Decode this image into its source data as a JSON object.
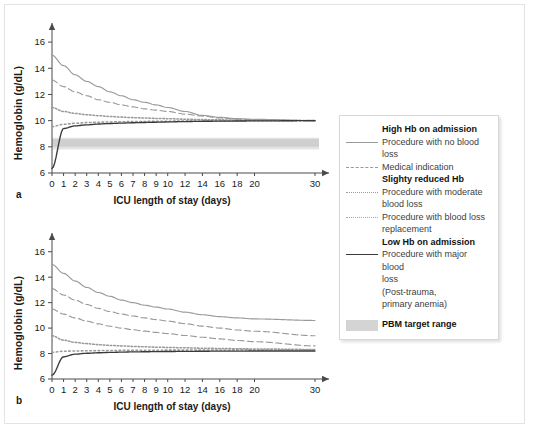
{
  "figure": {
    "panels": [
      {
        "letter": "a",
        "ylabel": "Hemoglobin (g/dL)",
        "xlabel": "ICU length of stay (days)"
      },
      {
        "letter": "b",
        "ylabel": "Hemoglobin (g/dL)",
        "xlabel": "ICU length of stay (days)"
      }
    ]
  },
  "legend": {
    "groups": [
      {
        "heading": "High Hb on admission",
        "entries": [
          {
            "style": "solid-gray",
            "label": "Procedure with no blood loss",
            "continuation": []
          },
          {
            "style": "dashed-gray",
            "label": "Medical indication",
            "continuation": []
          }
        ]
      },
      {
        "heading": "Slighty reduced Hb",
        "entries": [
          {
            "style": "dotted-fine",
            "label": "Procedure with moderate",
            "continuation": [
              "blood loss"
            ]
          },
          {
            "style": "dotted-coarse",
            "label": "Procedure with blood loss",
            "continuation": [
              "replacement"
            ]
          }
        ]
      },
      {
        "heading": "Low Hb on admission",
        "entries": [
          {
            "style": "solid-dark",
            "label": "Procedure with major blood",
            "continuation": [
              "loss",
              "(Post-trauma,",
              "primary anemia)"
            ]
          }
        ]
      }
    ],
    "band": {
      "label": "PBM target range",
      "color": "#d4d4d4"
    }
  },
  "colors": {
    "axis": "#4a4a4a",
    "line_gray": "#9a9a9a",
    "line_dark": "#3a3a3a",
    "band_core": "#cfcfcf",
    "band_edge": "#e4e4e4",
    "text": "#1a1a1a"
  },
  "chart_data": [
    {
      "type": "line",
      "title": "a",
      "xlabel": "ICU length of stay (days)",
      "ylabel": "Hemoglobin (g/dL)",
      "xlim": [
        0,
        30
      ],
      "ylim": [
        6,
        17
      ],
      "yticks": [
        6,
        8,
        10,
        12,
        14,
        16
      ],
      "xticks": [
        0,
        1,
        2,
        3,
        4,
        5,
        6,
        7,
        8,
        9,
        10,
        12,
        14,
        16,
        18,
        20,
        30
      ],
      "grid": false,
      "legend_position": "right-outside",
      "x": [
        0,
        1,
        2,
        3,
        4,
        5,
        6,
        7,
        8,
        9,
        10,
        12,
        14,
        16,
        18,
        20,
        30
      ],
      "series": [
        {
          "name": "Procedure with no blood loss",
          "style": "solid-gray",
          "values": [
            15.0,
            14.2,
            13.5,
            13.0,
            12.6,
            12.2,
            11.9,
            11.6,
            11.4,
            11.2,
            11.0,
            10.7,
            10.4,
            10.25,
            10.15,
            10.1,
            10.0
          ]
        },
        {
          "name": "Medical indication",
          "style": "dashed-gray",
          "values": [
            13.1,
            12.6,
            12.2,
            11.9,
            11.6,
            11.4,
            11.2,
            11.05,
            10.9,
            10.8,
            10.7,
            10.5,
            10.35,
            10.2,
            10.12,
            10.07,
            10.0
          ]
        },
        {
          "name": "Procedure with moderate blood loss",
          "style": "dotted-fine",
          "values": [
            11.0,
            10.7,
            10.55,
            10.45,
            10.38,
            10.32,
            10.27,
            10.23,
            10.2,
            10.17,
            10.15,
            10.11,
            10.08,
            10.06,
            10.04,
            10.03,
            10.0
          ]
        },
        {
          "name": "Procedure with blood loss replacement",
          "style": "dotted-coarse",
          "values": [
            9.55,
            9.72,
            9.8,
            9.85,
            9.88,
            9.9,
            9.92,
            9.93,
            9.94,
            9.95,
            9.96,
            9.97,
            9.98,
            9.98,
            9.99,
            9.99,
            10.0
          ]
        },
        {
          "name": "Procedure with major blood loss",
          "style": "solid-dark",
          "values": [
            6.35,
            9.4,
            9.6,
            9.68,
            9.74,
            9.78,
            9.81,
            9.84,
            9.86,
            9.88,
            9.9,
            9.93,
            9.95,
            9.96,
            9.97,
            9.98,
            10.0
          ]
        }
      ],
      "band": {
        "name": "PBM target range",
        "y_low": 7.8,
        "y_high": 8.7,
        "core_low": 8.0,
        "core_high": 8.6
      }
    },
    {
      "type": "line",
      "title": "b",
      "xlabel": "ICU length of stay (days)",
      "ylabel": "Hemoglobin (g/dL)",
      "xlim": [
        0,
        30
      ],
      "ylim": [
        6,
        17
      ],
      "yticks": [
        6,
        8,
        10,
        12,
        14,
        16
      ],
      "xticks": [
        0,
        1,
        2,
        3,
        4,
        5,
        6,
        7,
        8,
        9,
        10,
        12,
        14,
        16,
        18,
        20,
        30
      ],
      "grid": false,
      "legend_position": "right-outside",
      "x": [
        0,
        1,
        2,
        3,
        4,
        5,
        6,
        7,
        8,
        9,
        10,
        12,
        14,
        16,
        18,
        20,
        30
      ],
      "series": [
        {
          "name": "Procedure with no blood loss",
          "style": "solid-gray",
          "values": [
            15.0,
            14.3,
            13.7,
            13.2,
            12.8,
            12.5,
            12.2,
            12.0,
            11.8,
            11.65,
            11.5,
            11.25,
            11.05,
            10.9,
            10.8,
            10.72,
            10.6
          ]
        },
        {
          "name": "Medical indication",
          "style": "dashed-gray",
          "values": [
            13.1,
            12.6,
            12.2,
            11.85,
            11.55,
            11.3,
            11.1,
            10.95,
            10.8,
            10.67,
            10.55,
            10.35,
            10.15,
            10.0,
            9.85,
            9.75,
            9.4
          ]
        },
        {
          "name": "Procedure with moderate blood loss",
          "style": "dashed-gray-2",
          "values": [
            11.5,
            11.1,
            10.8,
            10.55,
            10.33,
            10.15,
            10.0,
            9.87,
            9.76,
            9.66,
            9.57,
            9.42,
            9.28,
            9.15,
            9.03,
            8.93,
            8.6
          ]
        },
        {
          "name": "Procedure with blood loss replacement",
          "style": "dotted-fine",
          "values": [
            9.4,
            9.05,
            8.88,
            8.78,
            8.7,
            8.64,
            8.6,
            8.56,
            8.53,
            8.5,
            8.48,
            8.45,
            8.42,
            8.4,
            8.38,
            8.36,
            8.32
          ]
        },
        {
          "name": "Procedure with blood loss replacement (2)",
          "style": "dotted-coarse",
          "values": [
            8.1,
            8.18,
            8.2,
            8.22,
            8.23,
            8.24,
            8.25,
            8.25,
            8.26,
            8.26,
            8.27,
            8.27,
            8.28,
            8.28,
            8.29,
            8.29,
            8.3
          ]
        },
        {
          "name": "Procedure with major blood loss",
          "style": "solid-dark",
          "values": [
            6.3,
            7.75,
            7.95,
            8.02,
            8.06,
            8.09,
            8.11,
            8.13,
            8.14,
            8.15,
            8.16,
            8.17,
            8.18,
            8.19,
            8.19,
            8.2,
            8.2
          ]
        }
      ],
      "band": null
    }
  ]
}
